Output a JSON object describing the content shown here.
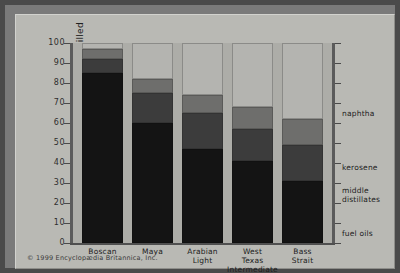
{
  "credit": "© 1999 Encyclopædia Britannica, Inc.",
  "legend": [
    {
      "label": "naphtha"
    },
    {
      "label": "kerosene"
    },
    {
      "label": "middle\ndistillates"
    },
    {
      "label": "fuel oils"
    }
  ],
  "chart_data": {
    "type": "bar",
    "stacked": true,
    "title": "",
    "xlabel": "",
    "ylabel": "volume percent distilled",
    "ylim": [
      0,
      100
    ],
    "yticks": [
      0,
      10,
      20,
      30,
      40,
      50,
      60,
      70,
      80,
      90,
      100
    ],
    "grid": false,
    "legend_position": "right",
    "categories": [
      "Boscan",
      "Maya",
      "Arabian Light",
      "West Texas Intermediate",
      "Bass Strait"
    ],
    "series": [
      {
        "name": "fuel oils",
        "values": [
          85,
          60,
          47,
          41,
          31
        ]
      },
      {
        "name": "middle distillates",
        "values": [
          7,
          15,
          18,
          16,
          18
        ]
      },
      {
        "name": "kerosene",
        "values": [
          5,
          7,
          9,
          11,
          13
        ]
      },
      {
        "name": "naphtha",
        "values": [
          3,
          18,
          26,
          32,
          38
        ]
      }
    ],
    "cumulative_tops": {
      "fuel oils": [
        85,
        60,
        47,
        41,
        31
      ],
      "middle distillates": [
        92,
        75,
        65,
        57,
        49
      ],
      "kerosene": [
        97,
        82,
        74,
        68,
        62
      ],
      "naphtha": [
        100,
        100,
        100,
        100,
        100
      ]
    }
  }
}
